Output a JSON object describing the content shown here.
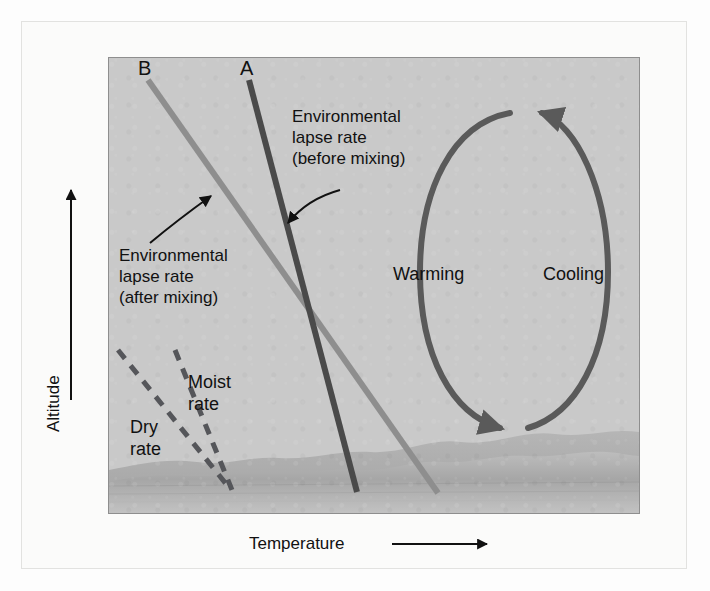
{
  "figure": {
    "type": "diagram",
    "panel_background": "#c9c9c9"
  },
  "axes": {
    "y": {
      "label": "Altitude",
      "arrow": "up-arrow-icon",
      "direction": "increasing upward"
    },
    "x": {
      "label": "Temperature",
      "arrow": "right-arrow-icon",
      "direction": "increasing rightward"
    }
  },
  "series": [
    {
      "id": "A",
      "label": "A",
      "color": "#4a4a4a",
      "style": "solid",
      "description": "Environmental lapse rate before mixing"
    },
    {
      "id": "B",
      "label": "B",
      "color": "#8e8e8e",
      "style": "solid",
      "description": "Environmental lapse rate after mixing"
    }
  ],
  "annotations": {
    "before_mixing": {
      "lines": [
        "Environmental",
        "lapse rate",
        "(before mixing)"
      ],
      "points_to": "A"
    },
    "after_mixing": {
      "lines": [
        "Environmental",
        "lapse rate",
        "(after mixing)"
      ],
      "points_to": "B"
    }
  },
  "rate_lines": [
    {
      "id": "moist",
      "lines": [
        "Moist",
        "rate"
      ],
      "style": "dashed",
      "color": "#55565a"
    },
    {
      "id": "dry",
      "lines": [
        "Dry",
        "rate"
      ],
      "style": "dashed",
      "color": "#55565a"
    }
  ],
  "cycle": {
    "left": {
      "label": "Warming",
      "arrow_direction": "downward"
    },
    "right": {
      "label": "Cooling",
      "arrow_direction": "upward"
    },
    "color": "#5a5a5a"
  },
  "ground": {
    "present": true,
    "description": "undulating terrain silhouette along the base of the panel",
    "color": "#a9a9a9"
  }
}
